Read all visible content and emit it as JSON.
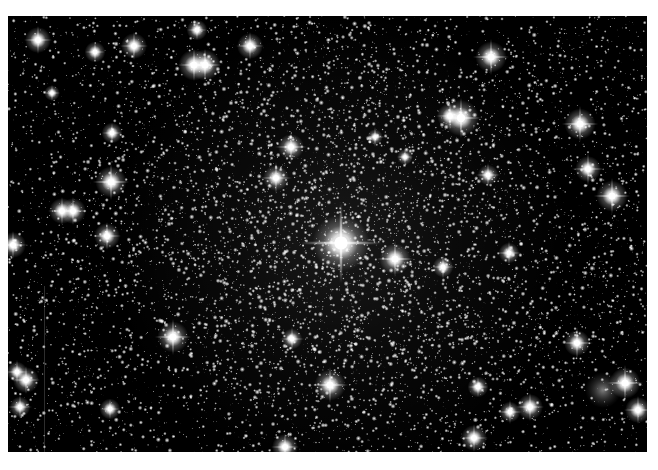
{
  "image": {
    "subject": "Dense star cluster field (globular cluster) on black sky",
    "frame": {
      "x": 8,
      "y": 16,
      "width": 639,
      "height": 436
    },
    "background_color": "#000000",
    "border_color": "#ffffff",
    "cluster_center": {
      "x": 333,
      "y": 227
    },
    "field_star_count": 5200,
    "cluster_star_count": 4200,
    "cluster_sigma": 150,
    "seed": 7,
    "streak": {
      "x": 36,
      "y0": 270,
      "y1": 436,
      "alpha": 0.18
    },
    "galaxy": {
      "x": 595,
      "y": 374,
      "r": 18,
      "brightness": 0.55
    },
    "bright_stars": [
      {
        "x": 333,
        "y": 227,
        "r": 11,
        "spike": 40
      },
      {
        "x": 30,
        "y": 24,
        "r": 5,
        "spike": 14
      },
      {
        "x": 87,
        "y": 36,
        "r": 4,
        "spike": 10
      },
      {
        "x": 126,
        "y": 30,
        "r": 5,
        "spike": 14
      },
      {
        "x": 104,
        "y": 117,
        "r": 4,
        "spike": 10
      },
      {
        "x": 44,
        "y": 77,
        "r": 3,
        "spike": 8
      },
      {
        "x": 189,
        "y": 14,
        "r": 4,
        "spike": 10
      },
      {
        "x": 186,
        "y": 49,
        "r": 6,
        "spike": 16
      },
      {
        "x": 197,
        "y": 49,
        "r": 6,
        "spike": 16
      },
      {
        "x": 242,
        "y": 30,
        "r": 5,
        "spike": 14
      },
      {
        "x": 283,
        "y": 131,
        "r": 5,
        "spike": 16
      },
      {
        "x": 268,
        "y": 162,
        "r": 5,
        "spike": 16
      },
      {
        "x": 367,
        "y": 121,
        "r": 3,
        "spike": 10
      },
      {
        "x": 397,
        "y": 141,
        "r": 3,
        "spike": 8
      },
      {
        "x": 483,
        "y": 41,
        "r": 6,
        "spike": 18
      },
      {
        "x": 442,
        "y": 100,
        "r": 5,
        "spike": 14
      },
      {
        "x": 453,
        "y": 102,
        "r": 7,
        "spike": 20
      },
      {
        "x": 572,
        "y": 108,
        "r": 6,
        "spike": 18
      },
      {
        "x": 580,
        "y": 153,
        "r": 5,
        "spike": 16
      },
      {
        "x": 604,
        "y": 180,
        "r": 6,
        "spike": 18
      },
      {
        "x": 480,
        "y": 159,
        "r": 4,
        "spike": 12
      },
      {
        "x": 103,
        "y": 166,
        "r": 6,
        "spike": 18
      },
      {
        "x": 54,
        "y": 195,
        "r": 5,
        "spike": 14
      },
      {
        "x": 65,
        "y": 195,
        "r": 5,
        "spike": 14
      },
      {
        "x": 99,
        "y": 220,
        "r": 5,
        "spike": 14
      },
      {
        "x": 5,
        "y": 229,
        "r": 5,
        "spike": 14
      },
      {
        "x": 387,
        "y": 243,
        "r": 6,
        "spike": 18
      },
      {
        "x": 435,
        "y": 251,
        "r": 4,
        "spike": 12
      },
      {
        "x": 501,
        "y": 237,
        "r": 4,
        "spike": 12
      },
      {
        "x": 569,
        "y": 327,
        "r": 5,
        "spike": 16
      },
      {
        "x": 165,
        "y": 321,
        "r": 6,
        "spike": 18
      },
      {
        "x": 284,
        "y": 323,
        "r": 4,
        "spike": 12
      },
      {
        "x": 322,
        "y": 369,
        "r": 6,
        "spike": 18
      },
      {
        "x": 9,
        "y": 356,
        "r": 4,
        "spike": 12
      },
      {
        "x": 18,
        "y": 364,
        "r": 5,
        "spike": 14
      },
      {
        "x": 12,
        "y": 391,
        "r": 4,
        "spike": 12
      },
      {
        "x": 102,
        "y": 393,
        "r": 4,
        "spike": 10
      },
      {
        "x": 617,
        "y": 367,
        "r": 6,
        "spike": 18
      },
      {
        "x": 466,
        "y": 422,
        "r": 5,
        "spike": 14
      },
      {
        "x": 502,
        "y": 396,
        "r": 4,
        "spike": 12
      },
      {
        "x": 522,
        "y": 391,
        "r": 5,
        "spike": 14
      },
      {
        "x": 277,
        "y": 431,
        "r": 5,
        "spike": 14
      },
      {
        "x": 470,
        "y": 371,
        "r": 4,
        "spike": 10
      },
      {
        "x": 630,
        "y": 394,
        "r": 5,
        "spike": 14
      }
    ]
  }
}
